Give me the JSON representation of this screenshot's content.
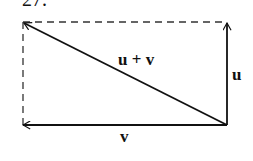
{
  "problem_number": "27.",
  "labels": {
    "sum": "u + v",
    "u": "u",
    "v": "v"
  },
  "colors": {
    "stroke": "#111111",
    "background": "#ffffff"
  }
}
